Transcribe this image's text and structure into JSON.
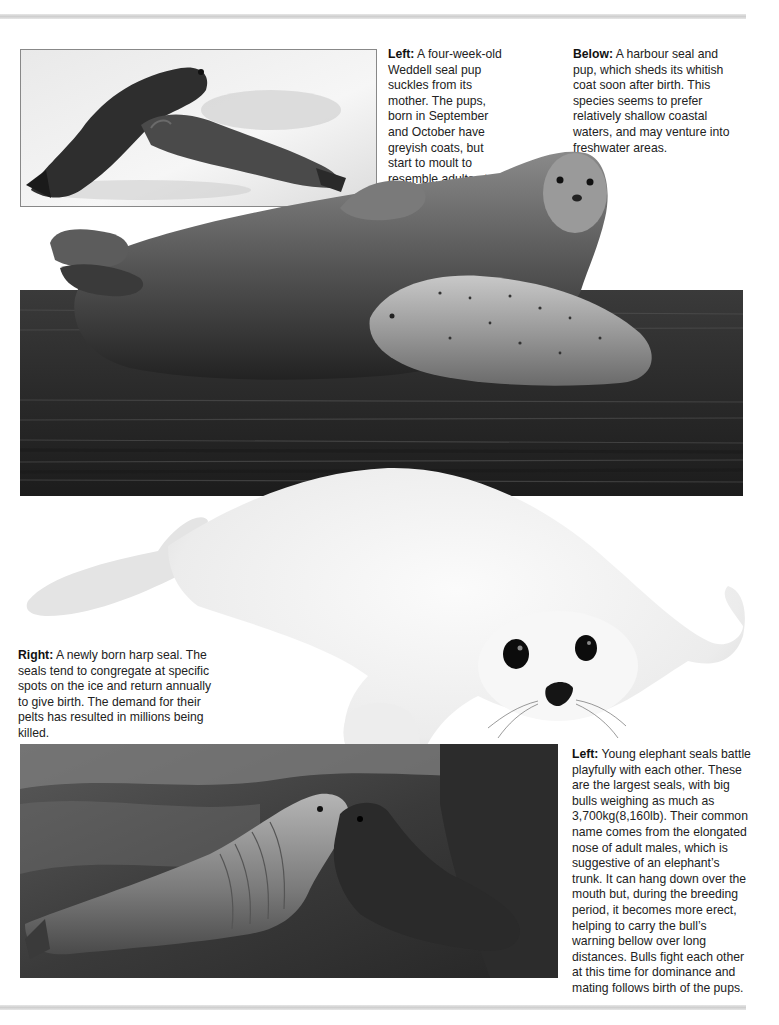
{
  "page": {
    "background": "#ffffff",
    "rule_color": "#d4d4d4"
  },
  "captions": [
    {
      "id": "weddell",
      "lead": "Left:",
      "text": " A four-week-old Weddell seal pup suckles from its mother. The pups, born in September and October have greyish coats, but start to moult to resemble adults at about this age."
    },
    {
      "id": "harbour",
      "lead": "Below:",
      "text": " A harbour seal and pup, which sheds its whitish coat soon after birth. This species seems to prefer relatively shallow coastal waters, and may venture into freshwater areas."
    },
    {
      "id": "harp",
      "lead": "Right:",
      "text": " A newly born harp seal. The seals tend to congregate at specific spots on the ice and return annually to give birth. The demand for their pelts has resulted in millions being killed."
    },
    {
      "id": "elephant",
      "lead": "Left:",
      "text": " Young elephant seals battle playfully with each other. These are the largest seals, with big bulls weighing as much as 3,700kg(8,160lb). Their common name comes from the elongated nose of adult males, which is suggestive of an elephant’s trunk. It can hang down over the mouth but, during the breeding period, it becomes more erect, helping to carry the bull’s warning bellow over long distances. Bulls fight each other at this time for dominance and mating follows birth of the pups."
    }
  ],
  "photos": [
    {
      "id": "weddell-photo",
      "subject": "Weddell seal pup suckling from mother on snow"
    },
    {
      "id": "harbour-photo",
      "subject": "Harbour seal and pup at water's edge"
    },
    {
      "id": "harp-photo",
      "subject": "Newly born white-coated harp seal pup"
    },
    {
      "id": "elephant-photo",
      "subject": "Two young elephant seals on rocky shore"
    }
  ]
}
